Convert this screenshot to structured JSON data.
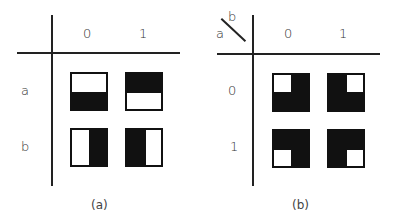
{
  "figure": {
    "panels": [
      {
        "id": "a",
        "caption": "(a)",
        "column_headers": [
          "0",
          "1"
        ],
        "row_headers": [
          "a",
          "b"
        ],
        "corner_label": null,
        "cells": [
          {
            "row": "a",
            "col": "0",
            "pattern": "top white, bottom black (horizontal split)"
          },
          {
            "row": "a",
            "col": "1",
            "pattern": "top black, bottom white (horizontal split)"
          },
          {
            "row": "b",
            "col": "0",
            "pattern": "left white, right black (vertical split)"
          },
          {
            "row": "b",
            "col": "1",
            "pattern": "left black, right white (vertical split)"
          }
        ]
      },
      {
        "id": "b",
        "caption": "(b)",
        "column_headers": [
          "0",
          "1"
        ],
        "row_headers": [
          "0",
          "1"
        ],
        "corner_label": {
          "row_var": "a",
          "col_var": "b"
        },
        "cells": [
          {
            "row": "0",
            "col": "0",
            "pattern": "black with white top-left quadrant"
          },
          {
            "row": "0",
            "col": "1",
            "pattern": "black with white top-right quadrant"
          },
          {
            "row": "1",
            "col": "0",
            "pattern": "black with white bottom-left quadrant"
          },
          {
            "row": "1",
            "col": "1",
            "pattern": "black with white bottom-right quadrant"
          }
        ]
      }
    ],
    "colors": {
      "ink": "#111111",
      "background": "#ffffff"
    }
  }
}
